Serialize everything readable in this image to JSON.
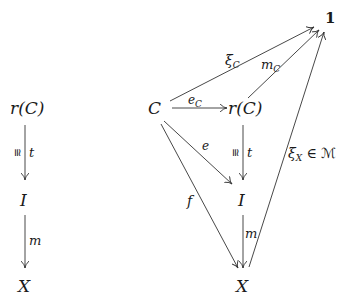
{
  "diagram": {
    "left": {
      "nodes": {
        "top": "r(C)",
        "mid": "I",
        "bottom": "X"
      },
      "edges": {
        "t": {
          "label": "t",
          "iso": "≅"
        },
        "m": {
          "label": "m"
        }
      }
    },
    "right": {
      "nodes": {
        "terminal": "1",
        "C": "C",
        "rC": "r(C)",
        "I": "I",
        "X": "X"
      },
      "edges": {
        "xiC": {
          "base": "ξ",
          "sub": "C"
        },
        "mC": {
          "base": "m",
          "sub": "C"
        },
        "eC": {
          "base": "e",
          "sub": "C"
        },
        "e": {
          "label": "e"
        },
        "f": {
          "label": "f"
        },
        "t": {
          "label": "t",
          "iso": "≅"
        },
        "m": {
          "label": "m"
        },
        "xiX": {
          "base": "ξ",
          "sub": "X",
          "suffix": " ∈ ℳ"
        }
      }
    },
    "stroke_color": "#333333"
  }
}
